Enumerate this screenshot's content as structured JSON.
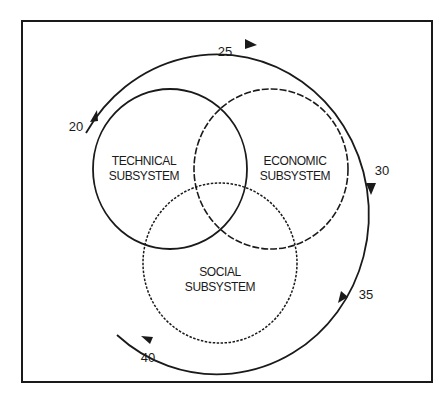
{
  "diagram": {
    "subsystems": [
      {
        "id": "technical",
        "line1": "TECHNICAL",
        "line2": "SUBSYSTEM",
        "stroke_style": "solid"
      },
      {
        "id": "economic",
        "line1": "ECONOMIC",
        "line2": "SUBSYSTEM",
        "stroke_style": "dashed"
      },
      {
        "id": "social",
        "line1": "SOCIAL",
        "line2": "SUBSYSTEM",
        "stroke_style": "dotted"
      }
    ],
    "cycle_markers": [
      "20",
      "25",
      "30",
      "35",
      "40"
    ],
    "colors": {
      "line": "#1a1a1a",
      "background": "#ffffff"
    }
  }
}
